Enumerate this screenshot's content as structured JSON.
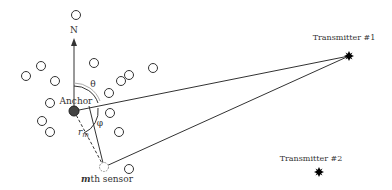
{
  "labels": {
    "north": "N",
    "anchor": "Anchor",
    "theta": "θ",
    "phi": "φ",
    "r_m": "r",
    "r_m_sub": "m",
    "sensor_prefix": "m",
    "sensor_suffix": "th sensor",
    "transmitter1": "Transmitter #1",
    "transmitter2": "Transmitter #2"
  },
  "colors": {
    "line": "#333333",
    "anchor_fill": "#444444",
    "circle_stroke": "#333333",
    "sensor_stroke": "#999999"
  },
  "nodes": {
    "anchor": {
      "x": 74,
      "y": 111
    },
    "sensor": {
      "x": 104,
      "y": 167
    },
    "transmitter1": {
      "x": 349,
      "y": 56
    },
    "transmitter2": {
      "x": 319,
      "y": 171
    }
  },
  "sensors": [
    {
      "x": 76,
      "y": 15
    },
    {
      "x": 41,
      "y": 66
    },
    {
      "x": 26,
      "y": 76
    },
    {
      "x": 55,
      "y": 81
    },
    {
      "x": 94,
      "y": 63
    },
    {
      "x": 121,
      "y": 81
    },
    {
      "x": 129,
      "y": 75
    },
    {
      "x": 153,
      "y": 68
    },
    {
      "x": 109,
      "y": 93
    },
    {
      "x": 110,
      "y": 113
    },
    {
      "x": 119,
      "y": 132
    },
    {
      "x": 50,
      "y": 103
    },
    {
      "x": 42,
      "y": 121
    },
    {
      "x": 50,
      "y": 132
    },
    {
      "x": 129,
      "y": 169
    }
  ]
}
